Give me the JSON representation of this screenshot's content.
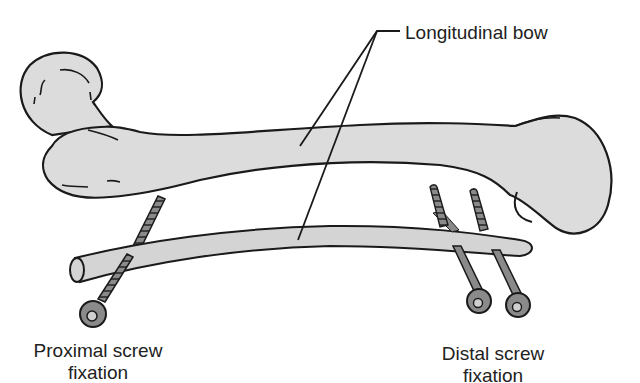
{
  "figure": {
    "labels": {
      "longitudinal_bow": "Longitudinal bow",
      "proximal_line1": "Proximal screw",
      "proximal_line2": "fixation",
      "distal_line1": "Distal screw",
      "distal_line2": "fixation"
    },
    "colors": {
      "bone_fill": "#dcdcdc",
      "rod_fill": "#d4d4d4",
      "screw_fill": "#8a8a8a",
      "outline": "#1a1a1a",
      "background": "#ffffff"
    },
    "parts": [
      "femur",
      "intramedullary-rod",
      "proximal-screw",
      "distal-screw-1",
      "distal-screw-2",
      "leader-lines"
    ]
  }
}
